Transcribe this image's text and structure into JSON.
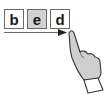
{
  "letters": [
    {
      "char": "b",
      "highlighted": false
    },
    {
      "char": "e",
      "highlighted": true
    },
    {
      "char": "d",
      "highlighted": false
    }
  ],
  "colors": {
    "highlight_fill": "#d2d2d2",
    "box_border": "#6a6a6a",
    "text": "#1a1a1a",
    "arrow": "#6a6a6a",
    "arrowhead": "#222222",
    "hand_fill": "#cfcfcf",
    "hand_stroke": "#333333",
    "cuff_fill": "#ffffff"
  },
  "gesture": {
    "type": "swipe-right",
    "arrow_direction": "right"
  }
}
